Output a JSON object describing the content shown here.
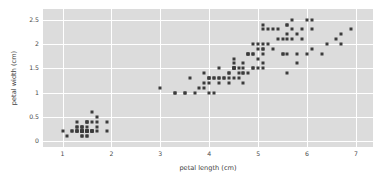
{
  "figure": {
    "background_color": "#ffffff",
    "panel_color": "#dcdcdc",
    "grid_color": "#ffffff",
    "marker_color": "#3b3b3b"
  },
  "chart_data": {
    "type": "scatter",
    "title": "",
    "xlabel": "petal length (cm)",
    "ylabel": "petal width (cm)",
    "xlim": [
      0.6,
      7.35
    ],
    "ylim": [
      -0.12,
      2.72
    ],
    "xticks": [
      1,
      2,
      3,
      4,
      5,
      6,
      7
    ],
    "xticklabels": [
      "1",
      "2",
      "3",
      "4",
      "5",
      "6",
      "7"
    ],
    "yticks": [
      0,
      0.5,
      1,
      1.5,
      2,
      2.5
    ],
    "yticklabels": [
      "0",
      "0.5",
      "1",
      "1.5",
      "2",
      "2.5"
    ],
    "grid": true,
    "legend": null,
    "marker": "square",
    "marker_size": 3,
    "series": [
      {
        "name": "iris petals",
        "color": "#3b3b3b",
        "x": [
          1.4,
          1.4,
          1.3,
          1.5,
          1.4,
          1.7,
          1.4,
          1.5,
          1.4,
          1.5,
          1.5,
          1.6,
          1.4,
          1.1,
          1.2,
          1.5,
          1.3,
          1.4,
          1.7,
          1.5,
          1.7,
          1.5,
          1.0,
          1.7,
          1.9,
          1.6,
          1.6,
          1.5,
          1.4,
          1.6,
          1.6,
          1.5,
          1.5,
          1.4,
          1.5,
          1.2,
          1.3,
          1.4,
          1.3,
          1.5,
          1.3,
          1.3,
          1.3,
          1.6,
          1.9,
          1.4,
          1.6,
          1.4,
          1.5,
          1.4,
          4.7,
          4.5,
          4.9,
          4.0,
          4.6,
          4.5,
          4.7,
          3.3,
          4.6,
          3.9,
          3.5,
          4.2,
          4.0,
          4.7,
          3.6,
          4.4,
          4.5,
          4.1,
          4.5,
          3.9,
          4.8,
          4.0,
          4.9,
          4.7,
          4.3,
          4.4,
          4.8,
          5.0,
          4.5,
          3.5,
          3.8,
          3.7,
          3.9,
          5.1,
          4.5,
          4.5,
          4.7,
          4.4,
          4.1,
          4.0,
          4.4,
          4.6,
          4.0,
          3.3,
          4.2,
          4.2,
          4.2,
          4.3,
          3.0,
          4.1,
          6.0,
          5.1,
          5.9,
          5.6,
          5.8,
          6.6,
          4.5,
          6.3,
          5.8,
          6.1,
          5.1,
          5.3,
          5.5,
          5.0,
          5.1,
          5.3,
          5.5,
          6.7,
          6.9,
          5.0,
          5.7,
          4.9,
          6.7,
          4.9,
          5.7,
          6.0,
          4.8,
          4.9,
          5.6,
          5.8,
          6.1,
          6.4,
          5.6,
          5.1,
          5.6,
          6.1,
          5.6,
          5.5,
          4.8,
          5.4,
          5.6,
          5.1,
          5.1,
          5.9,
          5.7,
          5.2,
          5.0,
          5.2,
          5.4,
          5.1
        ],
        "y": [
          0.2,
          0.2,
          0.2,
          0.2,
          0.2,
          0.4,
          0.3,
          0.2,
          0.2,
          0.1,
          0.2,
          0.2,
          0.1,
          0.1,
          0.2,
          0.4,
          0.4,
          0.3,
          0.3,
          0.3,
          0.2,
          0.4,
          0.2,
          0.5,
          0.2,
          0.2,
          0.4,
          0.2,
          0.2,
          0.2,
          0.2,
          0.4,
          0.1,
          0.2,
          0.2,
          0.2,
          0.2,
          0.1,
          0.2,
          0.2,
          0.3,
          0.3,
          0.2,
          0.6,
          0.4,
          0.3,
          0.2,
          0.2,
          0.2,
          0.2,
          1.4,
          1.5,
          1.5,
          1.3,
          1.5,
          1.3,
          1.6,
          1.0,
          1.3,
          1.4,
          1.0,
          1.5,
          1.0,
          1.4,
          1.3,
          1.4,
          1.5,
          1.0,
          1.5,
          1.1,
          1.8,
          1.3,
          1.5,
          1.2,
          1.3,
          1.4,
          1.4,
          1.7,
          1.5,
          1.0,
          1.1,
          1.0,
          1.2,
          1.6,
          1.5,
          1.6,
          1.5,
          1.3,
          1.3,
          1.3,
          1.2,
          1.4,
          1.2,
          1.0,
          1.3,
          1.2,
          1.3,
          1.3,
          1.1,
          1.3,
          2.5,
          1.9,
          2.1,
          1.8,
          2.2,
          2.1,
          1.7,
          1.8,
          1.8,
          2.5,
          2.0,
          1.9,
          2.1,
          2.0,
          2.4,
          2.3,
          1.8,
          2.2,
          2.3,
          1.5,
          2.3,
          2.0,
          2.0,
          1.8,
          2.1,
          1.8,
          1.8,
          1.8,
          2.1,
          1.6,
          1.9,
          2.0,
          2.2,
          1.5,
          1.4,
          2.3,
          2.4,
          1.8,
          1.8,
          2.1,
          2.4,
          2.3,
          1.9,
          2.3,
          2.5,
          2.3,
          1.9,
          2.0,
          2.3,
          1.8
        ]
      }
    ]
  }
}
